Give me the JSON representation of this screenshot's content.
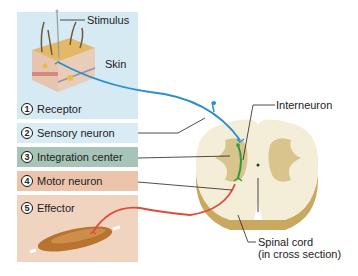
{
  "labels": {
    "stimulus": "Stimulus",
    "skin": "Skin",
    "interneuron": "Interneuron",
    "spinal_cord_line1": "Spinal cord",
    "spinal_cord_line2": "(in cross section)"
  },
  "steps": [
    {
      "number": "1",
      "label": "Receptor",
      "color": "#d6eaf4"
    },
    {
      "number": "2",
      "label": "Sensory neuron",
      "color": "#d9ecf6"
    },
    {
      "number": "3",
      "label": "Integration center",
      "color": "#a7c4b6"
    },
    {
      "number": "4",
      "label": "Motor neuron",
      "color": "#ecc4ac"
    },
    {
      "number": "5",
      "label": "Effector",
      "color": "#f1d4c0"
    }
  ],
  "colors": {
    "sensory": "#2a8fd0",
    "interneuron": "#2e9a3e",
    "motor": "#e04a3a",
    "cord_white": "#f4eed8",
    "cord_grey": "#d8c48c"
  }
}
